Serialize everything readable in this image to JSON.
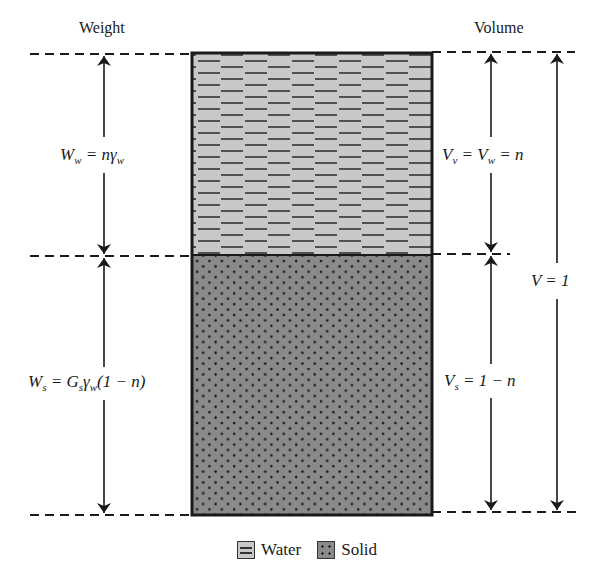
{
  "headers": {
    "weight": "Weight",
    "volume": "Volume"
  },
  "labels": {
    "Ww": {
      "main": "W",
      "sub": "w",
      "rest": " = nγ",
      "rest_sub": "w"
    },
    "Ws": {
      "main": "W",
      "sub": "s",
      "rest": " = G",
      "rest_sub": "s",
      "rest2": "γ",
      "rest2_sub": "w",
      "rest3": "(1 − n)"
    },
    "Vv": {
      "main": "V",
      "sub": "v",
      "mid": " = V",
      "mid_sub": "w",
      "rest": " = n"
    },
    "Vs": {
      "main": "V",
      "sub": "s",
      "rest": " = 1 − n"
    },
    "V": {
      "text": "V = 1"
    }
  },
  "legend": {
    "water": "Water",
    "solid": "Solid"
  },
  "colors": {
    "water_fill": "#c8c8c8",
    "solid_fill": "#8a8a8a",
    "line": "#1a1a1a"
  }
}
